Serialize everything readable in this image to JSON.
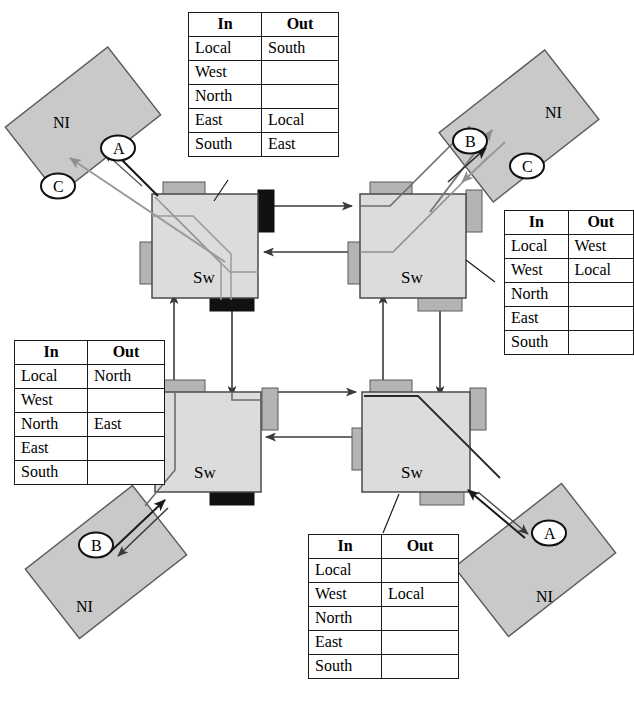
{
  "diagram": {
    "kind": "network-on-chip-routing",
    "switch_label": "Sw",
    "ni_label": "NI",
    "table_headers": {
      "in": "In",
      "out": "Out"
    },
    "port_names": [
      "Local",
      "West",
      "North",
      "East",
      "South"
    ],
    "colors": {
      "node_fill": "#d4d4d4",
      "node_fill_light": "#dcdcdc",
      "port_active": "#111111",
      "port_idle": "#b4b4b4",
      "line": "#3a3a3a",
      "path_dark": "#1a1a1a",
      "path_light": "#9a9a9a",
      "table_border": "#1a1a1a",
      "background": "#ffffff"
    }
  },
  "switches": [
    {
      "id": "sw-top-left",
      "label": "Sw"
    },
    {
      "id": "sw-top-right",
      "label": "Sw"
    },
    {
      "id": "sw-bottom-left",
      "label": "Sw"
    },
    {
      "id": "sw-bottom-right",
      "label": "Sw"
    }
  ],
  "network_interfaces": [
    {
      "id": "ni-top-left",
      "label": "NI"
    },
    {
      "id": "ni-top-right",
      "label": "NI"
    },
    {
      "id": "ni-bottom-left",
      "label": "NI"
    },
    {
      "id": "ni-bottom-right",
      "label": "NI"
    }
  ],
  "flow_bubbles": [
    {
      "id": "bubble-a-top-left",
      "label": "A"
    },
    {
      "id": "bubble-c-top-left",
      "label": "C"
    },
    {
      "id": "bubble-b-top-right",
      "label": "B"
    },
    {
      "id": "bubble-c-top-right",
      "label": "C"
    },
    {
      "id": "bubble-b-bottom-left",
      "label": "B"
    },
    {
      "id": "bubble-a-bottom-right",
      "label": "A"
    }
  ],
  "tables": {
    "top": {
      "id": "routing-table-top-left-switch",
      "header": {
        "in": "In",
        "out": "Out"
      },
      "rows": [
        {
          "in": "Local",
          "out": "South"
        },
        {
          "in": "West",
          "out": ""
        },
        {
          "in": "North",
          "out": ""
        },
        {
          "in": "East",
          "out": "Local"
        },
        {
          "in": "South",
          "out": "East"
        }
      ]
    },
    "right": {
      "id": "routing-table-top-right-switch",
      "header": {
        "in": "In",
        "out": "Out"
      },
      "rows": [
        {
          "in": "Local",
          "out": "West"
        },
        {
          "in": "West",
          "out": "Local"
        },
        {
          "in": "North",
          "out": ""
        },
        {
          "in": "East",
          "out": ""
        },
        {
          "in": "South",
          "out": ""
        }
      ]
    },
    "left": {
      "id": "routing-table-bottom-left-switch",
      "header": {
        "in": "In",
        "out": "Out"
      },
      "rows": [
        {
          "in": "Local",
          "out": "North"
        },
        {
          "in": "West",
          "out": ""
        },
        {
          "in": "North",
          "out": "East"
        },
        {
          "in": "East",
          "out": ""
        },
        {
          "in": "South",
          "out": ""
        }
      ]
    },
    "bottom": {
      "id": "routing-table-bottom-right-switch",
      "header": {
        "in": "In",
        "out": "Out"
      },
      "rows": [
        {
          "in": "Local",
          "out": ""
        },
        {
          "in": "West",
          "out": "Local"
        },
        {
          "in": "North",
          "out": ""
        },
        {
          "in": "East",
          "out": ""
        },
        {
          "in": "South",
          "out": ""
        }
      ]
    }
  }
}
